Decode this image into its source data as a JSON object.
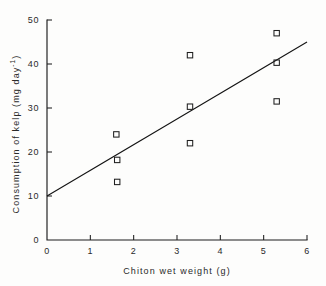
{
  "figure": {
    "background_color": "#fdfdfc",
    "ink_color": "#1d1d1d",
    "marker_style": "open-square"
  },
  "chart_data": {
    "type": "scatter",
    "title": "",
    "subtitle": "",
    "xlabel": "Chiton wet weight (g)",
    "ylabel": "Consumption of kelp (mg day",
    "ylabel_exponent": "-1",
    "ylabel_suffix": ")",
    "xlim": [
      0,
      6
    ],
    "ylim": [
      0,
      50
    ],
    "xticks": [
      0,
      1,
      2,
      3,
      4,
      5,
      6
    ],
    "yticks": [
      0,
      10,
      20,
      30,
      40,
      50
    ],
    "xtick_labels": [
      "0",
      "1",
      "2",
      "3",
      "4",
      "5",
      "6"
    ],
    "ytick_labels": [
      "0",
      "10",
      "20",
      "30",
      "40",
      "50"
    ],
    "grid": false,
    "legend": false,
    "legend_position": "none",
    "series": [
      {
        "name": "Individual chitons",
        "marker": "open-square",
        "points": [
          {
            "x": 1.6,
            "y": 24.0
          },
          {
            "x": 1.62,
            "y": 18.2
          },
          {
            "x": 1.62,
            "y": 13.2
          },
          {
            "x": 3.3,
            "y": 42.0
          },
          {
            "x": 3.3,
            "y": 30.3
          },
          {
            "x": 3.3,
            "y": 22.0
          },
          {
            "x": 5.3,
            "y": 47.0
          },
          {
            "x": 5.3,
            "y": 40.3
          },
          {
            "x": 5.3,
            "y": 31.5
          }
        ]
      }
    ],
    "fit_line": {
      "name": "Linear regression",
      "x_start": 0,
      "y_start": 10.0,
      "x_end": 6,
      "y_end": 45.0,
      "slope": 5.83,
      "intercept": 10.0
    }
  }
}
